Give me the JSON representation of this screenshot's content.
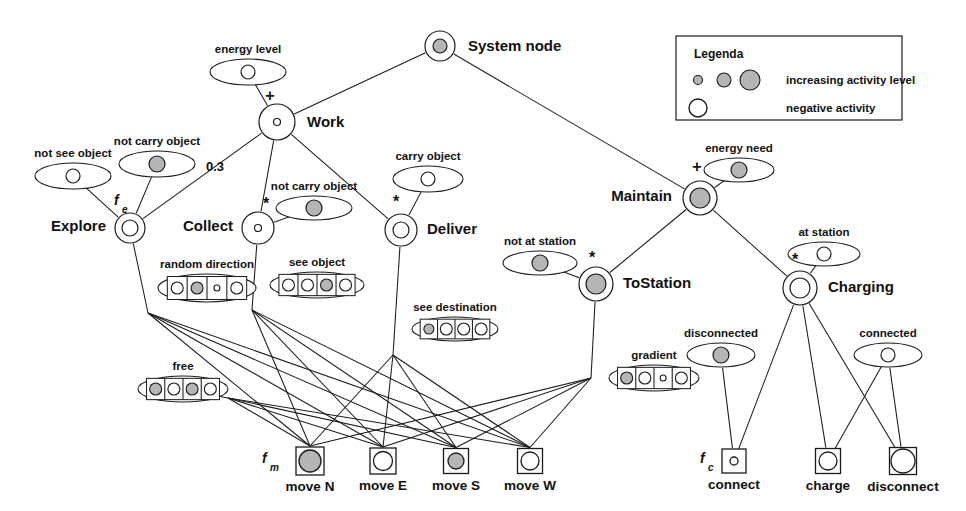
{
  "figure": {
    "background": "#ffffff",
    "stroke": "#1a1a1a",
    "fill_active": "#b5b5b5",
    "fill_negative": "#ffffff"
  },
  "legend": {
    "title": "Legenda",
    "rows": [
      {
        "id": "increasing",
        "label": "increasing activity level",
        "swatches": [
          "small-gray-circle",
          "medium-gray-circle",
          "large-gray-circle"
        ]
      },
      {
        "id": "negative",
        "label": "negative activity",
        "swatches": [
          "large-white-circle"
        ]
      }
    ]
  },
  "nodes": [
    {
      "id": "system",
      "label": "System node",
      "x": 440,
      "y": 46,
      "r": 15,
      "inner": 7,
      "fill": "#b5b5b5",
      "label_dx": 28,
      "label_dy": 5,
      "anchor": "start"
    },
    {
      "id": "work",
      "label": "Work",
      "x": 277,
      "y": 122,
      "r": 18,
      "inner": 3.5,
      "fill": "#ffffff",
      "label_dx": 30,
      "label_dy": 5,
      "anchor": "start"
    },
    {
      "id": "maintain",
      "label": "Maintain",
      "x": 700,
      "y": 198,
      "r": 17,
      "inner": 10,
      "fill": "#b5b5b5",
      "label_dx": -28,
      "label_dy": 3,
      "anchor": "end"
    },
    {
      "id": "explore",
      "label": "Explore",
      "x": 130,
      "y": 228,
      "r": 15,
      "inner": 8,
      "fill": "#ffffff",
      "label_dx": -24,
      "label_dy": 3,
      "anchor": "end"
    },
    {
      "id": "collect",
      "label": "Collect",
      "x": 258,
      "y": 228,
      "r": 16,
      "inner": 3.5,
      "fill": "#ffffff",
      "label_dx": -25,
      "label_dy": 3,
      "anchor": "end"
    },
    {
      "id": "deliver",
      "label": "Deliver",
      "x": 401,
      "y": 230,
      "r": 16,
      "inner": 8,
      "fill": "#ffffff",
      "label_dx": 26,
      "label_dy": 4,
      "anchor": "start"
    },
    {
      "id": "tostation",
      "label": "ToStation",
      "x": 596,
      "y": 284,
      "r": 17,
      "inner": 10,
      "fill": "#b5b5b5",
      "label_dx": 27,
      "label_dy": 4,
      "anchor": "start"
    },
    {
      "id": "charging",
      "label": "Charging",
      "x": 800,
      "y": 288,
      "r": 17,
      "inner": 10,
      "fill": "#ffffff",
      "label_dx": 28,
      "label_dy": 4,
      "anchor": "start"
    }
  ],
  "operators": [
    {
      "id": "work-plus",
      "symbol": "+",
      "x": 270,
      "y": 101
    },
    {
      "id": "maintain-plus",
      "symbol": "+",
      "x": 697,
      "y": 172
    },
    {
      "id": "collect-star",
      "symbol": "*",
      "x": 266,
      "y": 209
    },
    {
      "id": "deliver-star",
      "symbol": "*",
      "x": 396,
      "y": 207
    },
    {
      "id": "tostation-star",
      "symbol": "*",
      "x": 592,
      "y": 263
    },
    {
      "id": "charging-star",
      "symbol": "*",
      "x": 795,
      "y": 265
    }
  ],
  "weights": [
    {
      "id": "collect-weight",
      "value": "0.3",
      "x": 215,
      "y": 171
    }
  ],
  "functions": [
    {
      "id": "fe",
      "base": "f",
      "sub": "e",
      "x": 114,
      "y": 205
    },
    {
      "id": "fm",
      "base": "f",
      "sub": "m",
      "x": 262,
      "y": 463
    },
    {
      "id": "fc",
      "base": "f",
      "sub": "c",
      "x": 700,
      "y": 463
    }
  ],
  "sensors": [
    {
      "id": "energy-level",
      "label": "energy level",
      "cx": 248,
      "cy": 72,
      "rx": 38,
      "ry": 13,
      "cells": [
        {
          "fill": "#ffffff",
          "r": 7
        }
      ]
    },
    {
      "id": "not-see-object",
      "label": "not see object",
      "cx": 73,
      "cy": 176,
      "rx": 38,
      "ry": 13,
      "cells": [
        {
          "fill": "#ffffff",
          "r": 7
        }
      ]
    },
    {
      "id": "not-carry-work",
      "label": "not carry object",
      "cx": 157,
      "cy": 164,
      "rx": 38,
      "ry": 13,
      "cells": [
        {
          "fill": "#b5b5b5",
          "r": 8
        }
      ]
    },
    {
      "id": "carry-object",
      "label": "carry object",
      "cx": 428,
      "cy": 179,
      "rx": 35,
      "ry": 13,
      "cells": [
        {
          "fill": "#ffffff",
          "r": 7
        }
      ]
    },
    {
      "id": "not-carry-coll",
      "label": "not carry object",
      "cx": 314,
      "cy": 208,
      "rx": 38,
      "ry": 12,
      "cells": [
        {
          "fill": "#b5b5b5",
          "r": 8
        }
      ]
    },
    {
      "id": "not-at-station",
      "label": "not at station",
      "cx": 540,
      "cy": 263,
      "rx": 37,
      "ry": 12,
      "cells": [
        {
          "fill": "#b5b5b5",
          "r": 8
        }
      ]
    },
    {
      "id": "energy-need",
      "label": "energy need",
      "cx": 739,
      "cy": 170,
      "rx": 35,
      "ry": 12,
      "cells": [
        {
          "fill": "#b5b5b5",
          "r": 8
        }
      ]
    },
    {
      "id": "at-station",
      "label": "at station",
      "cx": 824,
      "cy": 254,
      "rx": 36,
      "ry": 12,
      "cells": [
        {
          "fill": "#ffffff",
          "r": 7
        }
      ]
    },
    {
      "id": "disconnected",
      "label": "disconnected",
      "cx": 721,
      "cy": 355,
      "rx": 34,
      "ry": 12,
      "cells": [
        {
          "fill": "#b5b5b5",
          "r": 8
        }
      ]
    },
    {
      "id": "connected",
      "label": "connected",
      "cx": 888,
      "cy": 355,
      "rx": 34,
      "ry": 12,
      "cells": [
        {
          "fill": "#ffffff",
          "r": 7
        }
      ]
    },
    {
      "id": "random-direction",
      "label": "random direction",
      "cx": 207,
      "cy": 288,
      "rx": 49,
      "ry": 14,
      "cells": [
        {
          "fill": "#ffffff",
          "r": 6
        },
        {
          "fill": "#b5b5b5",
          "r": 6
        },
        {
          "fill": "#ffffff",
          "r": 3
        },
        {
          "fill": "#ffffff",
          "r": 6
        }
      ]
    },
    {
      "id": "see-object",
      "label": "see object",
      "cx": 317,
      "cy": 285,
      "rx": 47,
      "ry": 13,
      "cells": [
        {
          "fill": "#ffffff",
          "r": 6
        },
        {
          "fill": "#ffffff",
          "r": 6
        },
        {
          "fill": "#b5b5b5",
          "r": 6
        },
        {
          "fill": "#ffffff",
          "r": 6
        }
      ]
    },
    {
      "id": "see-destination",
      "label": "see destination",
      "cx": 455,
      "cy": 329,
      "rx": 43,
      "ry": 12,
      "cells": [
        {
          "fill": "#b5b5b5",
          "r": 5
        },
        {
          "fill": "#ffffff",
          "r": 6
        },
        {
          "fill": "#ffffff",
          "r": 6
        },
        {
          "fill": "#ffffff",
          "r": 6
        }
      ]
    },
    {
      "id": "free",
      "label": "free",
      "cx": 183,
      "cy": 389,
      "rx": 45,
      "ry": 13,
      "cells": [
        {
          "fill": "#b5b5b5",
          "r": 6
        },
        {
          "fill": "#ffffff",
          "r": 6
        },
        {
          "fill": "#b5b5b5",
          "r": 6
        },
        {
          "fill": "#ffffff",
          "r": 6
        }
      ]
    },
    {
      "id": "gradient",
      "label": "gradient",
      "cx": 654,
      "cy": 378,
      "rx": 45,
      "ry": 13,
      "cells": [
        {
          "fill": "#b5b5b5",
          "r": 6
        },
        {
          "fill": "#ffffff",
          "r": 6
        },
        {
          "fill": "#ffffff",
          "r": 3
        },
        {
          "fill": "#ffffff",
          "r": 6
        }
      ]
    }
  ],
  "actions": [
    {
      "id": "move-n",
      "label": "move N",
      "x": 310,
      "y": 461,
      "size": 28,
      "inner": 11,
      "fill": "#b5b5b5"
    },
    {
      "id": "move-e",
      "label": "move E",
      "x": 383,
      "y": 461,
      "size": 26,
      "inner": 9.5,
      "fill": "#ffffff"
    },
    {
      "id": "move-s",
      "label": "move S",
      "x": 456,
      "y": 461,
      "size": 25,
      "inner": 8,
      "fill": "#b5b5b5"
    },
    {
      "id": "move-w",
      "label": "move W",
      "x": 530,
      "y": 461,
      "size": 25,
      "inner": 9,
      "fill": "#ffffff"
    },
    {
      "id": "connect",
      "label": "connect",
      "x": 734,
      "y": 461,
      "size": 24,
      "inner": 4,
      "fill": "#ffffff"
    },
    {
      "id": "charge",
      "label": "charge",
      "x": 828,
      "y": 461,
      "size": 25,
      "inner": 9,
      "fill": "#ffffff"
    },
    {
      "id": "disconnect",
      "label": "disconnect",
      "x": 903,
      "y": 461,
      "size": 27,
      "inner": 12,
      "fill": "#ffffff"
    }
  ],
  "edges": [
    {
      "id": "system-work",
      "from": "system",
      "to": "work"
    },
    {
      "id": "system-maintain",
      "from": "system",
      "to": "maintain"
    },
    {
      "id": "work-energy-level",
      "from": "work",
      "to": "energy-level"
    },
    {
      "id": "work-explore",
      "from": "work",
      "to": "explore"
    },
    {
      "id": "work-collect",
      "from": "work",
      "to": "collect"
    },
    {
      "id": "work-deliver",
      "from": "work",
      "to": "deliver"
    },
    {
      "id": "explore-notsee",
      "from": "explore",
      "to": "not-see-object"
    },
    {
      "id": "explore-notcarry",
      "from": "explore",
      "to": "not-carry-work"
    },
    {
      "id": "collect-notcarry",
      "from": "collect",
      "to": "not-carry-coll"
    },
    {
      "id": "deliver-carry",
      "from": "deliver",
      "to": "carry-object"
    },
    {
      "id": "maintain-need",
      "from": "maintain",
      "to": "energy-need"
    },
    {
      "id": "maintain-tostation",
      "from": "maintain",
      "to": "tostation"
    },
    {
      "id": "maintain-charging",
      "from": "maintain",
      "to": "charging"
    },
    {
      "id": "tostation-notat",
      "from": "tostation",
      "to": "not-at-station"
    },
    {
      "id": "charging-atstation",
      "from": "charging",
      "to": "at-station"
    },
    {
      "id": "disconnected-connect",
      "from": "disconnected",
      "to": "connect"
    },
    {
      "id": "charging-connect",
      "from": "charging",
      "to": "connect"
    },
    {
      "id": "charging-charge",
      "from": "charging",
      "to": "charge"
    },
    {
      "id": "charging-disconnect",
      "from": "charging",
      "to": "disconnect"
    },
    {
      "id": "connected-charge",
      "from": "connected",
      "to": "charge"
    },
    {
      "id": "connected-disconnect",
      "from": "connected",
      "to": "disconnect"
    }
  ],
  "fanouts": [
    {
      "id": "explore-fan",
      "source": "explore",
      "hub_x": 148,
      "hub_y": 313,
      "targets": [
        "move-n",
        "move-e",
        "move-s",
        "move-w"
      ]
    },
    {
      "id": "collect-fan",
      "source": "collect",
      "hub_x": 252,
      "hub_y": 310,
      "targets": [
        "move-n",
        "move-e",
        "move-s",
        "move-w"
      ]
    },
    {
      "id": "deliver-fan",
      "source": "deliver",
      "hub_x": 393,
      "hub_y": 355,
      "targets": [
        "move-n",
        "move-e",
        "move-s",
        "move-w"
      ]
    },
    {
      "id": "tostation-fan",
      "source": "tostation",
      "hub_x": 591,
      "hub_y": 378,
      "targets": [
        "move-n",
        "move-e",
        "move-s",
        "move-w"
      ]
    },
    {
      "id": "free-fan",
      "source": "free",
      "hub_x": 228,
      "hub_y": 398,
      "targets": [
        "move-n",
        "move-e",
        "move-s",
        "move-w"
      ]
    }
  ]
}
